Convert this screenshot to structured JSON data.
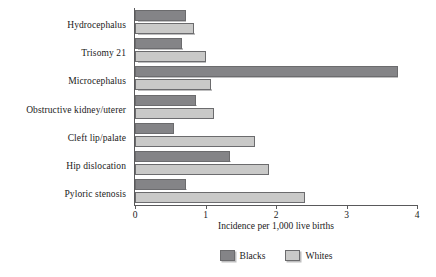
{
  "chart_data": {
    "type": "bar",
    "orientation": "horizontal",
    "title": "",
    "subtitle": "",
    "xlabel": "Incidence per 1,000 live births",
    "ylabel": "",
    "xlim": [
      0,
      4
    ],
    "xticks": [
      "0",
      "1",
      "2",
      "3",
      "4"
    ],
    "grid": false,
    "legend_position": "bottom-center",
    "categories": [
      "Hydrocephalus",
      "Trisomy 21",
      "Microcephalus",
      "Obstructive kidney/uterer",
      "Cleft lip/palate",
      "Hip dislocation",
      "Pyloric stenosis"
    ],
    "series": [
      {
        "name": "Blacks",
        "color": "#848487",
        "values": [
          0.72,
          0.67,
          3.73,
          0.87,
          0.55,
          1.35,
          0.73
        ]
      },
      {
        "name": "Whites",
        "color": "#c9c9c8",
        "values": [
          0.84,
          1.0,
          1.08,
          1.12,
          1.7,
          1.9,
          2.41
        ]
      }
    ]
  },
  "axis": {
    "x_label": "Incidence per 1,000 live births",
    "tick_labels": [
      "0",
      "1",
      "2",
      "3",
      "4"
    ]
  },
  "legend": {
    "items": [
      {
        "label": "Blacks",
        "swatch": "blacks-swatch"
      },
      {
        "label": "Whites",
        "swatch": "whites-swatch"
      }
    ]
  }
}
